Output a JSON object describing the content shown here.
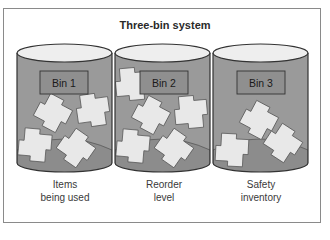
{
  "title": "Three-bin system",
  "colors": {
    "bin_body": "#9a9a9a",
    "bin_inner_bottom": "#8c8c8c",
    "bin_top": "#eeeeee",
    "label_box": "#8f8f8f",
    "item": "#e8e8e8",
    "outline": "#333333",
    "frame": "#8a8a8a"
  },
  "bins": [
    {
      "label": "Bin 1",
      "caption_line1": "Items",
      "caption_line2": "being used"
    },
    {
      "label": "Bin 2",
      "caption_line1": "Reorder",
      "caption_line2": "level"
    },
    {
      "label": "Bin 3",
      "caption_line1": "Safety",
      "caption_line2": "inventory"
    }
  ]
}
